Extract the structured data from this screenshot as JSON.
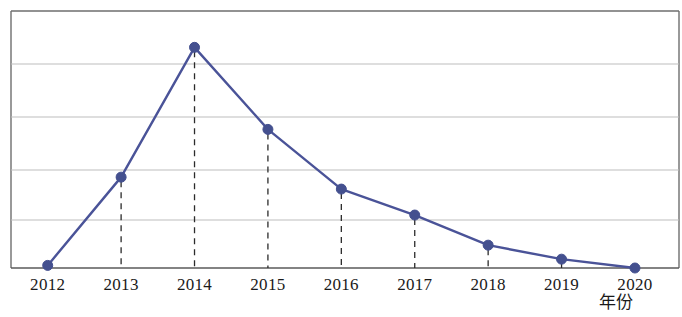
{
  "chart_data": {
    "type": "line",
    "title": "",
    "subtitle": "",
    "xlabel": "年份",
    "ylabel": "",
    "grid": true,
    "legend": false,
    "legend_position": "none",
    "categories": [
      "2012",
      "2013",
      "2014",
      "2015",
      "2016",
      "2017",
      "2018",
      "2019",
      "2020"
    ],
    "x": [
      2012,
      2013,
      2014,
      2015,
      2016,
      2017,
      2018,
      2019,
      2020
    ],
    "values": [
      0.05,
      1.75,
      4.25,
      2.67,
      1.52,
      1.02,
      0.44,
      0.17,
      0.0
    ],
    "series": [
      {
        "name": "",
        "values": [
          0.05,
          1.75,
          4.25,
          2.67,
          1.52,
          1.02,
          0.44,
          0.17,
          0.0
        ],
        "color": "#4a5398",
        "marker": "circle"
      }
    ],
    "xlim": [
      2011.5,
      2020.6
    ],
    "ylim": [
      0,
      4.95
    ],
    "y_gridlines": [
      1,
      2,
      3,
      4
    ],
    "annotations": [],
    "drop_lines": true
  },
  "axis": {
    "x_tick_labels": [
      "2012",
      "2013",
      "2014",
      "2015",
      "2016",
      "2017",
      "2018",
      "2019",
      "2020"
    ],
    "x_axis_title": "年份",
    "y_tick_labels": []
  },
  "style": {
    "series_color": "#4a5398",
    "marker_color": "#44508f",
    "grid_color": "#b9b9b9",
    "frame_color": "#6e6e6e",
    "axis_color": "#5a5a5a",
    "drop_line_color": "#2b2b2b",
    "text_color": "#1a1a1a",
    "background": "#ffffff"
  }
}
